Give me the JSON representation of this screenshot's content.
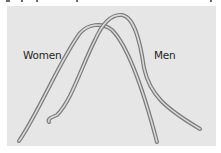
{
  "figure": {
    "labels": {
      "women": "Women",
      "men": "Men"
    },
    "colors": {
      "panel_background": "#e6e6e6",
      "page_background": "#ffffff",
      "curve_outline": "#7a7a7a",
      "curve_core": "#d9d9d9",
      "label_text": "#1f1f1f"
    },
    "curves": [
      {
        "name": "Women",
        "shape": "bell curve, wider and shifted left",
        "start": [
          19,
          141
        ],
        "peak": [
          96,
          25
        ],
        "end": [
          157,
          142
        ]
      },
      {
        "name": "Men",
        "shape": "bell curve, shifted right and taller, with long right tail",
        "start": [
          48,
          121
        ],
        "peak": [
          120,
          14
        ],
        "end": [
          200,
          129
        ]
      }
    ]
  }
}
